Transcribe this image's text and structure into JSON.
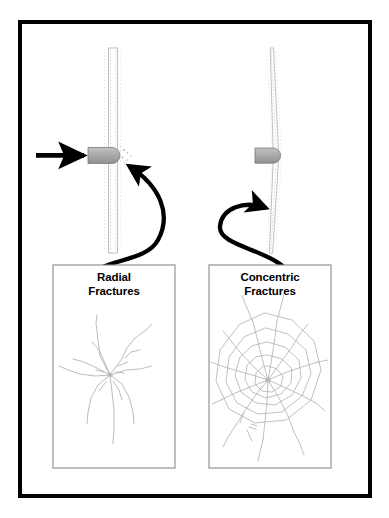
{
  "figure": {
    "title_present": false,
    "background_color": "#ffffff",
    "border_color": "#000000",
    "border_width_px": 4,
    "frame": {
      "x": 18,
      "y": 20,
      "width": 354,
      "height": 478
    }
  },
  "colors": {
    "ink": "#000000",
    "bullet_fill": "#a8a8a8",
    "bullet_stroke": "#6e6e6e",
    "glass_stroke": "#b9b9b9",
    "glass_dotted": "#c9c9c9",
    "panel_border": "#8a8a8a",
    "fracture_stroke": "#b0b0b0",
    "page": "#ffffff"
  },
  "impact_arrow": {
    "icon": "right-arrow-icon",
    "label": "bullet travel direction",
    "from_x": 36,
    "to_x": 86,
    "y": 155
  },
  "glass_panes": [
    {
      "id": "left-pane",
      "label": "glass pane straight",
      "description": "thin vertical glass pane viewed edge-on, straight",
      "x": 113,
      "top_y": 48,
      "bottom_y": 253
    },
    {
      "id": "right-pane",
      "label": "glass pane bowed",
      "description": "thin vertical glass pane viewed edge-on, bowed at impact",
      "x": 272,
      "top_y": 48,
      "bottom_y": 253
    }
  ],
  "bullets": [
    {
      "id": "left-bullet",
      "label": "bullet at impact point",
      "x": 92,
      "y": 155
    },
    {
      "id": "right-bullet",
      "label": "bullet embedded in pane",
      "x": 258,
      "y": 155
    }
  ],
  "callout_arrows": [
    {
      "id": "radial-callout",
      "label": "curved callout arrow linking impact to radial fracture panel",
      "double_headed": true,
      "from": "impact-point-left",
      "to": "radial-fracture-photo"
    },
    {
      "id": "concentric-callout",
      "label": "curved callout arrow linking impact to concentric fracture panel",
      "double_headed": true,
      "from": "impact-point-right",
      "to": "concentric-fracture-photo"
    }
  ],
  "panels": [
    {
      "id": "radial-panel",
      "caption": "Radial\nFractures",
      "caption_line1": "Radial",
      "caption_line2": "Fractures",
      "pattern": "radial",
      "pattern_description": "straight cracks radiating outward from central impact point",
      "box": {
        "x": 53,
        "y": 265,
        "width": 122,
        "height": 203
      }
    },
    {
      "id": "concentric-panel",
      "caption": "Concentric\nFractures",
      "caption_line1": "Concentric",
      "caption_line2": "Fractures",
      "pattern": "concentric",
      "pattern_description": "radial cracks joined by encircling concentric rings forming a web",
      "box": {
        "x": 209,
        "y": 265,
        "width": 122,
        "height": 203
      }
    }
  ]
}
